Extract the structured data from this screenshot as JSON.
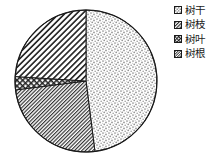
{
  "chart_data": {
    "type": "pie",
    "title": "",
    "categories": [
      "树干",
      "树枝",
      "树叶",
      "树根"
    ],
    "values": [
      48,
      24,
      3,
      25
    ],
    "units": "percent",
    "start_angle_deg": 0,
    "direction": "clockwise",
    "legend_position": "right",
    "grid": false,
    "slices": [
      {
        "label": "树干",
        "value": 48,
        "pattern": "stipple-dots",
        "start_deg": 0,
        "end_deg": 172.8,
        "color": "#bdbdbd"
      },
      {
        "label": "树根",
        "value": 25,
        "pattern": "fine-diagonal-hatch",
        "start_deg": 172.8,
        "end_deg": 262.8,
        "color": "#4a4a4a"
      },
      {
        "label": "树叶",
        "value": 3,
        "pattern": "cross-hatch",
        "start_deg": 262.8,
        "end_deg": 273.6,
        "color": "#333333"
      },
      {
        "label": "树枝",
        "value": 24,
        "pattern": "coarse-diagonal-hatch",
        "start_deg": 273.6,
        "end_deg": 360,
        "color": "#3d3d3d"
      }
    ]
  },
  "legend": {
    "items": [
      {
        "label": "树干",
        "swatch": "stipple-swatch-icon"
      },
      {
        "label": "树枝",
        "swatch": "diagonal-hatch-swatch-icon"
      },
      {
        "label": "树叶",
        "swatch": "cross-hatch-swatch-icon"
      },
      {
        "label": "树根",
        "swatch": "fine-diagonal-swatch-icon"
      }
    ]
  },
  "colors": {
    "outline": "#1a1a1a",
    "text": "#1c1c1c",
    "background": "#ffffff"
  }
}
